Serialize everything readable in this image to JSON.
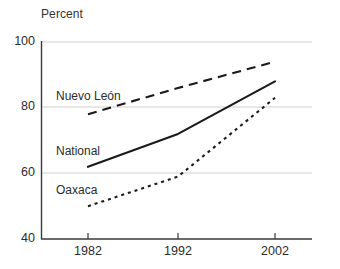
{
  "chart_data": {
    "type": "line",
    "title": "",
    "ylabel": "Percent",
    "xlabel": "",
    "x": [
      1982,
      1992,
      2002
    ],
    "xtick_labels": [
      "1982",
      "1992",
      "2002"
    ],
    "ytick_labels": [
      "100",
      "80",
      "60",
      "40"
    ],
    "yticks": [
      100,
      80,
      60,
      40
    ],
    "ylim": [
      40,
      100
    ],
    "grid": "horizontal",
    "legend": "inline-labels",
    "series": [
      {
        "name": "Nuevo León",
        "values": [
          78,
          86,
          94
        ],
        "style": "dashed",
        "color": "#1a1a1a"
      },
      {
        "name": "National",
        "values": [
          62,
          72,
          88
        ],
        "style": "solid",
        "color": "#1a1a1a"
      },
      {
        "name": "Oaxaca",
        "values": [
          50,
          59,
          83
        ],
        "style": "dotted",
        "color": "#1a1a1a"
      }
    ]
  },
  "axes": {
    "y_title": "Percent",
    "y_tick_100": "100",
    "y_tick_80": "80",
    "y_tick_60": "60",
    "y_tick_40": "40",
    "x_tick_1982": "1982",
    "x_tick_1992": "1992",
    "x_tick_2002": "2002"
  },
  "series_labels": {
    "nuevo_leon": "Nuevo León",
    "national": "National",
    "oaxaca": "Oaxaca"
  },
  "colors": {
    "line": "#1a1a1a",
    "gridline": "#cfcfcf",
    "axis": "#3a3a3a",
    "text": "#2b2b2b",
    "background": "#ffffff"
  }
}
